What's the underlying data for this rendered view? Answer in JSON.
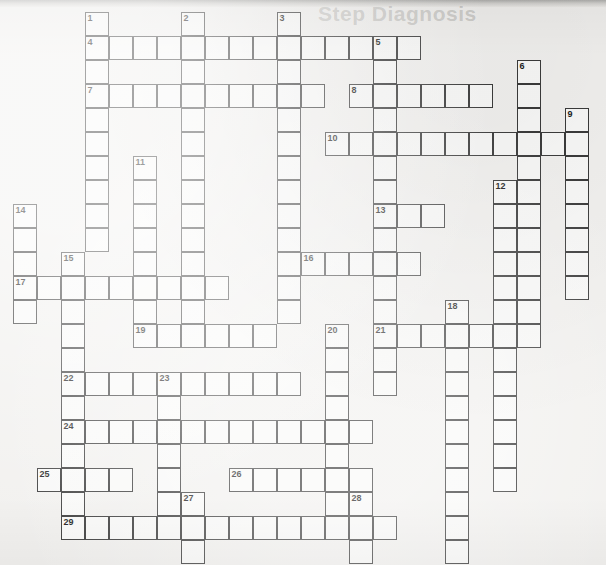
{
  "page": {
    "kind": "crossword-puzzle-grid",
    "title": "",
    "width": 606,
    "height": 565,
    "background_color": "#f2f1ef",
    "cell_border_color": "#3b3b3b",
    "cell_fill_color": "#ffffff",
    "number_color": "#1d1d1d"
  },
  "ghost_text": [
    {
      "text": "Step Diagnosis",
      "x": 318,
      "y": 6,
      "size": 21
    }
  ],
  "grid": {
    "origin_x": 13,
    "origin_y": 12,
    "cell_size": 24,
    "columns": 24,
    "rows": 23
  },
  "entries": [
    {
      "number": "1",
      "direction": "down",
      "col": 3,
      "row": 0,
      "length": 9
    },
    {
      "number": "2",
      "direction": "down",
      "col": 7,
      "row": 0,
      "length": 12
    },
    {
      "number": "3",
      "direction": "down",
      "col": 11,
      "row": 0,
      "length": 12
    },
    {
      "number": "4",
      "direction": "across",
      "col": 3,
      "row": 1,
      "length": 14
    },
    {
      "number": "5",
      "direction": "down",
      "col": 15,
      "row": 1,
      "length": 13
    },
    {
      "number": "6",
      "direction": "down",
      "col": 21,
      "row": 2,
      "length": 13
    },
    {
      "number": "7",
      "direction": "across",
      "col": 3,
      "row": 3,
      "length": 10
    },
    {
      "number": "8",
      "direction": "across",
      "col": 14,
      "row": 3,
      "length": 6
    },
    {
      "number": "9",
      "direction": "down",
      "col": 23,
      "row": 4,
      "length": 10
    },
    {
      "number": "10",
      "direction": "across",
      "col": 13,
      "row": 5,
      "length": 11
    },
    {
      "number": "11",
      "direction": "down",
      "col": 5,
      "row": 6,
      "length": 11
    },
    {
      "number": "12",
      "direction": "down",
      "col": 20,
      "row": 7,
      "length": 9
    },
    {
      "number": "13",
      "direction": "across",
      "col": 15,
      "row": 8,
      "length": 3
    },
    {
      "number": "14",
      "direction": "down",
      "col": 0,
      "row": 8,
      "length": 5
    },
    {
      "number": "15",
      "direction": "down",
      "col": 2,
      "row": 10,
      "length": 9
    },
    {
      "number": "16",
      "direction": "across",
      "col": 12,
      "row": 10,
      "length": 5
    },
    {
      "number": "17",
      "direction": "across",
      "col": 0,
      "row": 11,
      "length": 9
    },
    {
      "number": "18",
      "direction": "down",
      "col": 18,
      "row": 12,
      "length": 10
    },
    {
      "number": "19",
      "direction": "across",
      "col": 5,
      "row": 13,
      "length": 6
    },
    {
      "number": "20",
      "direction": "down",
      "col": 13,
      "row": 13,
      "length": 9
    },
    {
      "number": "21",
      "direction": "across",
      "col": 15,
      "row": 13,
      "length": 7
    },
    {
      "number": "22",
      "direction": "across",
      "col": 2,
      "row": 15,
      "length": 10
    },
    {
      "number": "23",
      "direction": "down",
      "col": 6,
      "row": 15,
      "length": 6
    },
    {
      "number": "24",
      "direction": "across",
      "col": 2,
      "row": 17,
      "length": 13
    },
    {
      "number": "25",
      "direction": "across",
      "col": 1,
      "row": 19,
      "length": 4
    },
    {
      "number": "26",
      "direction": "across",
      "col": 9,
      "row": 19,
      "length": 6
    },
    {
      "number": "27",
      "direction": "down",
      "col": 7,
      "row": 20,
      "length": 3
    },
    {
      "number": "28",
      "direction": "down",
      "col": 14,
      "row": 20,
      "length": 3
    },
    {
      "number": "29",
      "direction": "across",
      "col": 2,
      "row": 21,
      "length": 14
    }
  ],
  "cells": [
    {
      "col": 3,
      "row": 0,
      "num": "1"
    },
    {
      "col": 7,
      "row": 0,
      "num": "2"
    },
    {
      "col": 11,
      "row": 0,
      "num": "3"
    },
    {
      "col": 3,
      "row": 1,
      "num": "4"
    },
    {
      "col": 4,
      "row": 1
    },
    {
      "col": 5,
      "row": 1
    },
    {
      "col": 6,
      "row": 1
    },
    {
      "col": 7,
      "row": 1
    },
    {
      "col": 8,
      "row": 1
    },
    {
      "col": 9,
      "row": 1
    },
    {
      "col": 10,
      "row": 1
    },
    {
      "col": 11,
      "row": 1
    },
    {
      "col": 12,
      "row": 1
    },
    {
      "col": 13,
      "row": 1
    },
    {
      "col": 14,
      "row": 1
    },
    {
      "col": 15,
      "row": 1,
      "num": "5"
    },
    {
      "col": 16,
      "row": 1
    },
    {
      "col": 3,
      "row": 2
    },
    {
      "col": 7,
      "row": 2
    },
    {
      "col": 11,
      "row": 2
    },
    {
      "col": 15,
      "row": 2
    },
    {
      "col": 21,
      "row": 2,
      "num": "6"
    },
    {
      "col": 3,
      "row": 3,
      "num": "7"
    },
    {
      "col": 4,
      "row": 3
    },
    {
      "col": 5,
      "row": 3
    },
    {
      "col": 6,
      "row": 3
    },
    {
      "col": 7,
      "row": 3
    },
    {
      "col": 8,
      "row": 3
    },
    {
      "col": 9,
      "row": 3
    },
    {
      "col": 10,
      "row": 3
    },
    {
      "col": 11,
      "row": 3
    },
    {
      "col": 12,
      "row": 3
    },
    {
      "col": 14,
      "row": 3,
      "num": "8"
    },
    {
      "col": 15,
      "row": 3
    },
    {
      "col": 16,
      "row": 3
    },
    {
      "col": 17,
      "row": 3
    },
    {
      "col": 18,
      "row": 3
    },
    {
      "col": 19,
      "row": 3
    },
    {
      "col": 21,
      "row": 3
    },
    {
      "col": 3,
      "row": 4
    },
    {
      "col": 7,
      "row": 4
    },
    {
      "col": 11,
      "row": 4
    },
    {
      "col": 15,
      "row": 4
    },
    {
      "col": 21,
      "row": 4
    },
    {
      "col": 23,
      "row": 4,
      "num": "9"
    },
    {
      "col": 3,
      "row": 5
    },
    {
      "col": 7,
      "row": 5
    },
    {
      "col": 11,
      "row": 5
    },
    {
      "col": 13,
      "row": 5,
      "num": "10"
    },
    {
      "col": 14,
      "row": 5
    },
    {
      "col": 15,
      "row": 5
    },
    {
      "col": 16,
      "row": 5
    },
    {
      "col": 17,
      "row": 5
    },
    {
      "col": 18,
      "row": 5
    },
    {
      "col": 19,
      "row": 5
    },
    {
      "col": 20,
      "row": 5
    },
    {
      "col": 21,
      "row": 5
    },
    {
      "col": 22,
      "row": 5
    },
    {
      "col": 23,
      "row": 5
    },
    {
      "col": 3,
      "row": 6
    },
    {
      "col": 5,
      "row": 6,
      "num": "11"
    },
    {
      "col": 7,
      "row": 6
    },
    {
      "col": 11,
      "row": 6
    },
    {
      "col": 15,
      "row": 6
    },
    {
      "col": 21,
      "row": 6
    },
    {
      "col": 23,
      "row": 6
    },
    {
      "col": 3,
      "row": 7
    },
    {
      "col": 5,
      "row": 7
    },
    {
      "col": 7,
      "row": 7
    },
    {
      "col": 11,
      "row": 7
    },
    {
      "col": 15,
      "row": 7
    },
    {
      "col": 20,
      "row": 7,
      "num": "12"
    },
    {
      "col": 21,
      "row": 7
    },
    {
      "col": 23,
      "row": 7
    },
    {
      "col": 0,
      "row": 8,
      "num": "14"
    },
    {
      "col": 3,
      "row": 8
    },
    {
      "col": 5,
      "row": 8
    },
    {
      "col": 7,
      "row": 8
    },
    {
      "col": 11,
      "row": 8
    },
    {
      "col": 15,
      "row": 8,
      "num": "13"
    },
    {
      "col": 16,
      "row": 8
    },
    {
      "col": 17,
      "row": 8
    },
    {
      "col": 20,
      "row": 8
    },
    {
      "col": 21,
      "row": 8
    },
    {
      "col": 23,
      "row": 8
    },
    {
      "col": 0,
      "row": 9
    },
    {
      "col": 3,
      "row": 9
    },
    {
      "col": 5,
      "row": 9
    },
    {
      "col": 7,
      "row": 9
    },
    {
      "col": 11,
      "row": 9
    },
    {
      "col": 15,
      "row": 9
    },
    {
      "col": 20,
      "row": 9
    },
    {
      "col": 21,
      "row": 9
    },
    {
      "col": 23,
      "row": 9
    },
    {
      "col": 0,
      "row": 10
    },
    {
      "col": 2,
      "row": 10,
      "num": "15"
    },
    {
      "col": 5,
      "row": 10
    },
    {
      "col": 7,
      "row": 10
    },
    {
      "col": 11,
      "row": 10
    },
    {
      "col": 12,
      "row": 10,
      "num": "16"
    },
    {
      "col": 13,
      "row": 10
    },
    {
      "col": 14,
      "row": 10
    },
    {
      "col": 15,
      "row": 10
    },
    {
      "col": 16,
      "row": 10
    },
    {
      "col": 20,
      "row": 10
    },
    {
      "col": 21,
      "row": 10
    },
    {
      "col": 23,
      "row": 10
    },
    {
      "col": 0,
      "row": 11,
      "num": "17"
    },
    {
      "col": 1,
      "row": 11
    },
    {
      "col": 2,
      "row": 11
    },
    {
      "col": 3,
      "row": 11
    },
    {
      "col": 4,
      "row": 11
    },
    {
      "col": 5,
      "row": 11
    },
    {
      "col": 6,
      "row": 11
    },
    {
      "col": 7,
      "row": 11
    },
    {
      "col": 8,
      "row": 11
    },
    {
      "col": 11,
      "row": 11
    },
    {
      "col": 15,
      "row": 11
    },
    {
      "col": 20,
      "row": 11
    },
    {
      "col": 21,
      "row": 11
    },
    {
      "col": 23,
      "row": 11
    },
    {
      "col": 0,
      "row": 12
    },
    {
      "col": 2,
      "row": 12
    },
    {
      "col": 5,
      "row": 12
    },
    {
      "col": 7,
      "row": 12
    },
    {
      "col": 11,
      "row": 12
    },
    {
      "col": 15,
      "row": 12
    },
    {
      "col": 18,
      "row": 12,
      "num": "18"
    },
    {
      "col": 20,
      "row": 12
    },
    {
      "col": 21,
      "row": 12
    },
    {
      "col": 2,
      "row": 13
    },
    {
      "col": 5,
      "row": 13,
      "num": "19"
    },
    {
      "col": 6,
      "row": 13
    },
    {
      "col": 7,
      "row": 13
    },
    {
      "col": 8,
      "row": 13
    },
    {
      "col": 9,
      "row": 13
    },
    {
      "col": 10,
      "row": 13
    },
    {
      "col": 13,
      "row": 13,
      "num": "20"
    },
    {
      "col": 15,
      "row": 13,
      "num": "21"
    },
    {
      "col": 16,
      "row": 13
    },
    {
      "col": 17,
      "row": 13
    },
    {
      "col": 18,
      "row": 13
    },
    {
      "col": 19,
      "row": 13
    },
    {
      "col": 20,
      "row": 13
    },
    {
      "col": 21,
      "row": 13
    },
    {
      "col": 2,
      "row": 14
    },
    {
      "col": 13,
      "row": 14
    },
    {
      "col": 15,
      "row": 14
    },
    {
      "col": 18,
      "row": 14
    },
    {
      "col": 20,
      "row": 14
    },
    {
      "col": 2,
      "row": 15,
      "num": "22"
    },
    {
      "col": 3,
      "row": 15
    },
    {
      "col": 4,
      "row": 15
    },
    {
      "col": 5,
      "row": 15
    },
    {
      "col": 6,
      "row": 15,
      "num": "23"
    },
    {
      "col": 7,
      "row": 15
    },
    {
      "col": 8,
      "row": 15
    },
    {
      "col": 9,
      "row": 15
    },
    {
      "col": 10,
      "row": 15
    },
    {
      "col": 11,
      "row": 15
    },
    {
      "col": 13,
      "row": 15
    },
    {
      "col": 15,
      "row": 15
    },
    {
      "col": 18,
      "row": 15
    },
    {
      "col": 20,
      "row": 15
    },
    {
      "col": 2,
      "row": 16
    },
    {
      "col": 6,
      "row": 16
    },
    {
      "col": 13,
      "row": 16
    },
    {
      "col": 18,
      "row": 16
    },
    {
      "col": 20,
      "row": 16
    },
    {
      "col": 2,
      "row": 17,
      "num": "24"
    },
    {
      "col": 3,
      "row": 17
    },
    {
      "col": 4,
      "row": 17
    },
    {
      "col": 5,
      "row": 17
    },
    {
      "col": 6,
      "row": 17
    },
    {
      "col": 7,
      "row": 17
    },
    {
      "col": 8,
      "row": 17
    },
    {
      "col": 9,
      "row": 17
    },
    {
      "col": 10,
      "row": 17
    },
    {
      "col": 11,
      "row": 17
    },
    {
      "col": 12,
      "row": 17
    },
    {
      "col": 13,
      "row": 17
    },
    {
      "col": 14,
      "row": 17
    },
    {
      "col": 18,
      "row": 17
    },
    {
      "col": 20,
      "row": 17
    },
    {
      "col": 2,
      "row": 18
    },
    {
      "col": 6,
      "row": 18
    },
    {
      "col": 13,
      "row": 18
    },
    {
      "col": 18,
      "row": 18
    },
    {
      "col": 20,
      "row": 18
    },
    {
      "col": 1,
      "row": 19,
      "num": "25"
    },
    {
      "col": 2,
      "row": 19
    },
    {
      "col": 3,
      "row": 19
    },
    {
      "col": 4,
      "row": 19
    },
    {
      "col": 6,
      "row": 19
    },
    {
      "col": 9,
      "row": 19,
      "num": "26"
    },
    {
      "col": 10,
      "row": 19
    },
    {
      "col": 11,
      "row": 19
    },
    {
      "col": 12,
      "row": 19
    },
    {
      "col": 13,
      "row": 19
    },
    {
      "col": 14,
      "row": 19
    },
    {
      "col": 18,
      "row": 19
    },
    {
      "col": 20,
      "row": 19
    },
    {
      "col": 2,
      "row": 20
    },
    {
      "col": 6,
      "row": 20
    },
    {
      "col": 7,
      "row": 20,
      "num": "27"
    },
    {
      "col": 13,
      "row": 20
    },
    {
      "col": 14,
      "row": 20,
      "num": "28"
    },
    {
      "col": 18,
      "row": 20
    },
    {
      "col": 2,
      "row": 21,
      "num": "29"
    },
    {
      "col": 3,
      "row": 21
    },
    {
      "col": 4,
      "row": 21
    },
    {
      "col": 5,
      "row": 21
    },
    {
      "col": 6,
      "row": 21
    },
    {
      "col": 7,
      "row": 21
    },
    {
      "col": 8,
      "row": 21
    },
    {
      "col": 9,
      "row": 21
    },
    {
      "col": 10,
      "row": 21
    },
    {
      "col": 11,
      "row": 21
    },
    {
      "col": 12,
      "row": 21
    },
    {
      "col": 13,
      "row": 21
    },
    {
      "col": 14,
      "row": 21
    },
    {
      "col": 15,
      "row": 21
    },
    {
      "col": 18,
      "row": 21
    },
    {
      "col": 7,
      "row": 22
    },
    {
      "col": 14,
      "row": 22
    },
    {
      "col": 18,
      "row": 22
    }
  ]
}
